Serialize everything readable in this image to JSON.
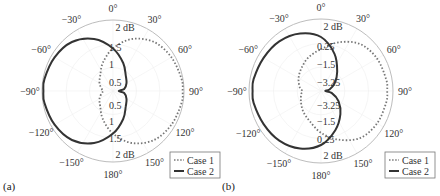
{
  "chart_data": [
    {
      "panel_label": "(a)",
      "type": "polar-line",
      "title": "",
      "angle_ticks": [
        "0°",
        "30°",
        "60°",
        "90°",
        "120°",
        "150°",
        "180°",
        "-150°",
        "-120°",
        "-90°",
        "-60°",
        "-30°"
      ],
      "radial_unit_label": "2 dB",
      "radial_tick_labels": [
        "1.5",
        "1",
        "0.5",
        "0.5",
        "1",
        "1.5"
      ],
      "legend": [
        "Case 1",
        "Case 2"
      ],
      "legend_position": "lower right",
      "series": [
        {
          "name": "Case 1",
          "style": "dotted",
          "angles_deg": [
            0,
            20,
            40,
            60,
            80,
            90,
            100,
            120,
            140,
            160,
            180,
            -160,
            -140,
            -120,
            -100,
            -90,
            -80,
            -60,
            -40,
            -20
          ],
          "radius_frac": [
            0.6,
            0.78,
            0.9,
            0.95,
            0.98,
            0.98,
            0.98,
            0.95,
            0.9,
            0.78,
            0.6,
            0.42,
            0.28,
            0.22,
            0.16,
            0.14,
            0.16,
            0.22,
            0.28,
            0.42
          ]
        },
        {
          "name": "Case 2",
          "style": "solid",
          "angles_deg": [
            0,
            20,
            40,
            60,
            80,
            90,
            100,
            120,
            140,
            160,
            180,
            -160,
            -140,
            -120,
            -100,
            -90,
            -80,
            -60,
            -40,
            -20
          ],
          "radius_frac": [
            0.6,
            0.42,
            0.28,
            0.22,
            0.16,
            0.08,
            0.16,
            0.22,
            0.28,
            0.42,
            0.6,
            0.78,
            0.9,
            0.95,
            0.98,
            0.98,
            0.98,
            0.95,
            0.9,
            0.78
          ]
        }
      ]
    },
    {
      "panel_label": "(b)",
      "type": "polar-line",
      "title": "",
      "angle_ticks": [
        "0°",
        "30°",
        "60°",
        "90°",
        "120°",
        "150°",
        "180°",
        "-150°",
        "-120°",
        "-90°",
        "-60°",
        "-30°"
      ],
      "radial_unit_label": "2 dB",
      "radial_tick_labels": [
        "0.25",
        "-1.5",
        "-3.25",
        "-3.25",
        "-1.5",
        "0.25"
      ],
      "legend": [
        "Case 1",
        "Case 2"
      ],
      "legend_position": "lower right",
      "series": [
        {
          "name": "Case 1",
          "style": "dotted",
          "angles_deg": [
            0,
            20,
            40,
            60,
            80,
            90,
            100,
            120,
            140,
            160,
            180,
            -160,
            -140,
            -120,
            -100,
            -90,
            -80,
            -60,
            -40,
            -20
          ],
          "radius_frac": [
            0.58,
            0.72,
            0.85,
            0.9,
            0.92,
            0.92,
            0.92,
            0.9,
            0.85,
            0.72,
            0.58,
            0.45,
            0.38,
            0.32,
            0.28,
            0.26,
            0.3,
            0.36,
            0.42,
            0.5
          ]
        },
        {
          "name": "Case 2",
          "style": "solid",
          "angles_deg": [
            0,
            20,
            40,
            60,
            80,
            90,
            100,
            120,
            140,
            160,
            180,
            -160,
            -140,
            -120,
            -100,
            -90,
            -80,
            -60,
            -40,
            -20
          ],
          "radius_frac": [
            0.75,
            0.55,
            0.35,
            0.22,
            0.12,
            0.06,
            0.15,
            0.28,
            0.42,
            0.58,
            0.75,
            0.85,
            0.9,
            0.92,
            0.95,
            0.95,
            0.95,
            0.92,
            0.9,
            0.85
          ]
        }
      ]
    }
  ]
}
